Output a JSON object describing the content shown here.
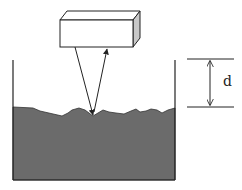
{
  "diagram": {
    "labels": {
      "distance": "d"
    },
    "colors": {
      "liquid": "#6b6b6b",
      "stroke": "#222222",
      "sensor_face": "#ffffff",
      "sensor_side": "#c8c8c8",
      "background": "#ffffff"
    },
    "elements": {
      "sensor": "rectangular box sensor",
      "container": "open container",
      "liquid": "liquid with rough surface",
      "incident_ray": "downward ray",
      "reflected_ray": "upward ray with arrowhead",
      "dimension": "double-headed arrow between two horizontal reference lines"
    }
  }
}
